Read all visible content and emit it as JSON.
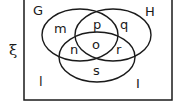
{
  "universal_symbol": "ξ",
  "sets": [
    {
      "name": "G"
    },
    {
      "name": "H"
    },
    {
      "name": "I"
    }
  ],
  "regions": {
    "G_only": "m",
    "G_H_only": "p",
    "H_only": "q",
    "G_I_only": "n",
    "G_H_I": "o",
    "H_I_only": "r",
    "I_only": "s",
    "outside": "l"
  },
  "colors": {
    "stroke": "#1a1a1a",
    "background": "#ffffff"
  }
}
